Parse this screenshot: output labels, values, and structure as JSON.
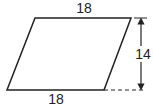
{
  "diagram": {
    "type": "parallelogram",
    "labels": {
      "top_side": "18",
      "bottom_side": "18",
      "height": "14"
    },
    "colors": {
      "stroke": "#222222",
      "background": "#ffffff"
    }
  }
}
